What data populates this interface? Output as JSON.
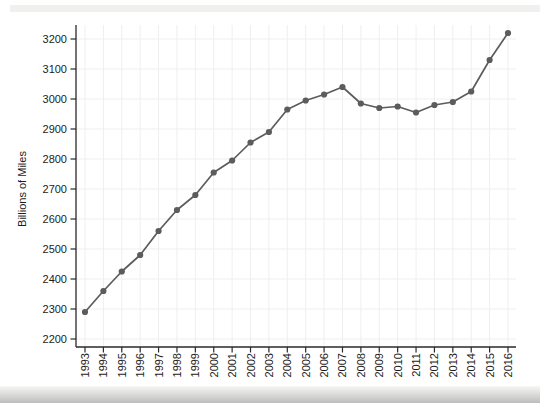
{
  "figure": {
    "title": "",
    "scan_artifacts": {
      "top_band_color": "#f0f0ee",
      "bottom_band_top_color": "#f7f7f5",
      "bottom_band_bottom_color": "#bdbdbb"
    }
  },
  "chart_data": {
    "type": "line",
    "title": "",
    "xlabel": "",
    "ylabel": "Billions of Miles",
    "x": [
      1993,
      1994,
      1995,
      1996,
      1997,
      1998,
      1999,
      2000,
      2001,
      2002,
      2003,
      2004,
      2005,
      2006,
      2007,
      2008,
      2009,
      2010,
      2011,
      2012,
      2013,
      2014,
      2015,
      2016
    ],
    "values": [
      2290,
      2360,
      2425,
      2480,
      2560,
      2630,
      2680,
      2755,
      2795,
      2855,
      2890,
      2965,
      2995,
      3015,
      3040,
      2985,
      2970,
      2975,
      2955,
      2980,
      2990,
      3025,
      3130,
      3220
    ],
    "ylim": [
      2200,
      3200
    ],
    "yticks": [
      2200,
      2300,
      2400,
      2500,
      2600,
      2700,
      2800,
      2900,
      3000,
      3100,
      3200
    ],
    "grid": true,
    "legend": "none",
    "marker": "circle",
    "line_color": "#5c5c5c",
    "marker_color": "#5c5c5c",
    "axis_color": "#2a2a2a",
    "grid_color": "#f0efed",
    "tick_label_color": "#1c1c1c"
  }
}
